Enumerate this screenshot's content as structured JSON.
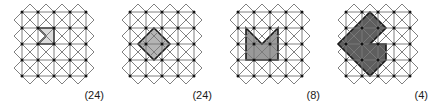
{
  "figure": {
    "type": "geometric-tiling-diagram",
    "lattice": {
      "grid_cells": 4,
      "cell_size": 16,
      "origin_x": 22,
      "origin_y": 12,
      "diagonals": true,
      "border_triangles": true,
      "line_color": "#7a7a7a",
      "vertex_color": "#111111",
      "vertex_radius": 1.5
    },
    "panels": [
      {
        "id": "panel-1",
        "count_label": "(24)",
        "count_value": 24,
        "fill": "#dcdcdc",
        "stroke": "#1a1a1a",
        "shape_name": "single-cell-chevron",
        "points": "38,28 54,28 54,44 38,44 46,36"
      },
      {
        "id": "panel-2",
        "count_label": "(24)",
        "count_value": 24,
        "fill": "#b4b4b4",
        "stroke": "#1a1a1a",
        "shape_name": "diamond-with-notch",
        "points": "46,28 54,36 62,44 46,60 30,44 38,36"
      },
      {
        "id": "panel-3",
        "count_label": "(8)",
        "count_value": 8,
        "fill": "#9a9a9a",
        "stroke": "#1a1a1a",
        "shape_name": "two-by-two-block-with-v-notch",
        "points": "30,28 46,44 62,28 62,60 30,60"
      },
      {
        "id": "panel-4",
        "count_label": "(4)",
        "count_value": 4,
        "fill": "#5e5e5e",
        "stroke": "#1a1a1a",
        "shape_name": "large-diamond-with-square-notch",
        "points": "46,12 62,28 46,44 62,44 62,60 46,76 14,44 30,28"
      }
    ]
  }
}
